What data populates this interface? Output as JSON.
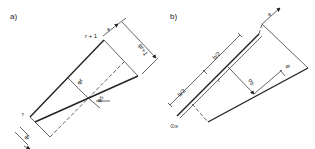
{
  "panels": [
    {
      "id": "a",
      "label": "a)",
      "labels": {
        "node_top": "r + 1",
        "node_bottom": "r",
        "axis": "s",
        "dim_top": "φr+1",
        "dim_mid": "φr",
        "dim_angle": "φs",
        "dim_bottom": "φr"
      }
    },
    {
      "id": "b",
      "label": "b)",
      "labels": {
        "axis": "s",
        "half_width_1": "b/2",
        "half_width_2": "b/2",
        "dim_small": "t",
        "dim_mid": "σs",
        "dim_angle": "θ",
        "origin": "⊙x"
      }
    }
  ],
  "colors": {
    "line": "#222222",
    "background": "#ffffff"
  }
}
